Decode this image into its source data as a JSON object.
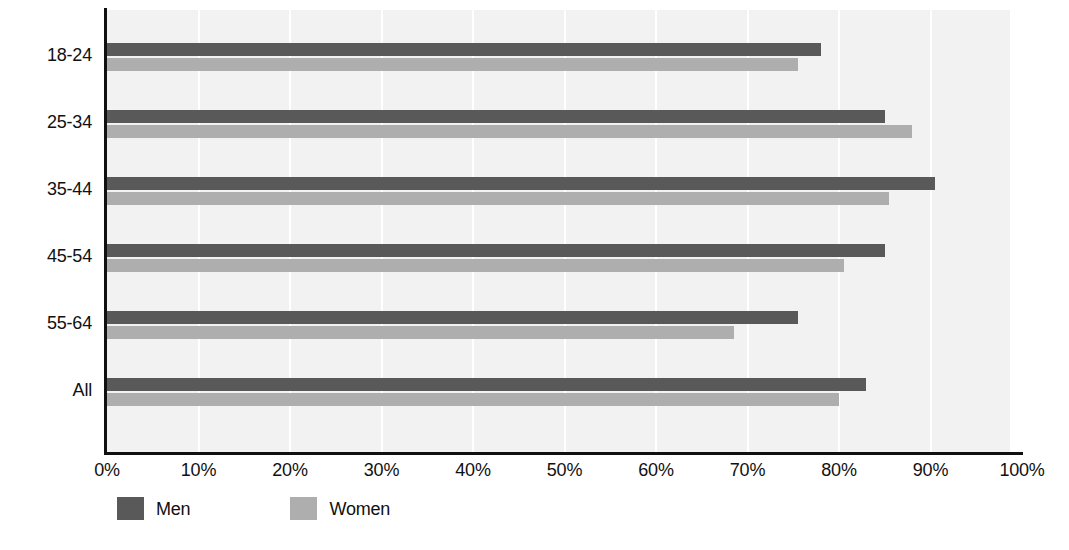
{
  "chart_data": {
    "type": "bar",
    "orientation": "horizontal",
    "title": "",
    "xlabel": "",
    "ylabel": "",
    "xlim": [
      0,
      100
    ],
    "xticks": [
      "0%",
      "10%",
      "20%",
      "30%",
      "40%",
      "50%",
      "60%",
      "70%",
      "80%",
      "90%",
      "100%"
    ],
    "xtick_values": [
      0,
      10,
      20,
      30,
      40,
      50,
      60,
      70,
      80,
      90,
      100
    ],
    "categories": [
      "18-24",
      "25-34",
      "35-44",
      "45-54",
      "55-64",
      "All"
    ],
    "grid": "vertical",
    "legend_position": "bottom-left",
    "series": [
      {
        "name": "Men",
        "color": "#595959",
        "values": [
          78.0,
          85.0,
          90.5,
          85.0,
          75.5,
          83.0
        ]
      },
      {
        "name": "Women",
        "color": "#aeaeae",
        "values": [
          75.5,
          88.0,
          85.5,
          80.5,
          68.5,
          80.0
        ]
      }
    ]
  },
  "legend": {
    "items": [
      {
        "label": "Men",
        "color": "#595959"
      },
      {
        "label": "Women",
        "color": "#aeaeae"
      }
    ]
  },
  "colors": {
    "plot_background": "#f2f2f2",
    "gridline": "#ffffff",
    "axis": "#101010",
    "men": "#595959",
    "women": "#aeaeae"
  }
}
